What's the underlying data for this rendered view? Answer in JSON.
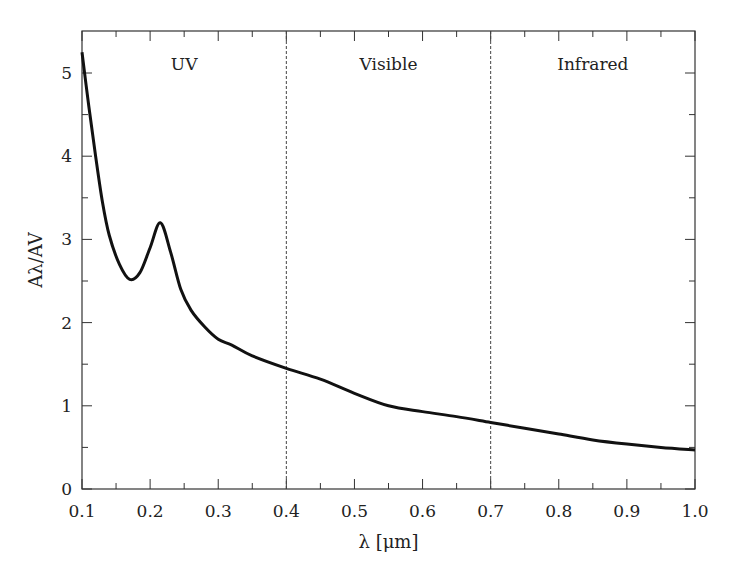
{
  "chart_data": {
    "type": "line",
    "title": "",
    "xlabel": "λ [μm]",
    "ylabel": "Aλ/AV",
    "xlim": [
      0.1,
      1.0
    ],
    "ylim": [
      0,
      5.3
    ],
    "xticks": [
      "0.1",
      "0.2",
      "0.3",
      "0.4",
      "0.5",
      "0.6",
      "0.7",
      "0.8",
      "0.9",
      "1.0"
    ],
    "yticks": [
      "0",
      "1",
      "2",
      "3",
      "4",
      "5"
    ],
    "grid": false,
    "regions": [
      {
        "label": "UV",
        "from": 0.1,
        "to": 0.4
      },
      {
        "label": "Visible",
        "from": 0.4,
        "to": 0.7
      },
      {
        "label": "Infrared",
        "from": 0.7,
        "to": 1.0
      }
    ],
    "boundaries": [
      0.4,
      0.7
    ],
    "series": [
      {
        "name": "extinction curve",
        "x": [
          0.1,
          0.11,
          0.12,
          0.13,
          0.14,
          0.155,
          0.17,
          0.185,
          0.2,
          0.215,
          0.23,
          0.245,
          0.26,
          0.28,
          0.3,
          0.32,
          0.35,
          0.4,
          0.45,
          0.5,
          0.55,
          0.6,
          0.65,
          0.7,
          0.75,
          0.8,
          0.85,
          0.9,
          0.95,
          1.0
        ],
        "y": [
          5.25,
          4.6,
          4.0,
          3.45,
          3.05,
          2.7,
          2.52,
          2.6,
          2.9,
          3.2,
          2.85,
          2.4,
          2.15,
          1.95,
          1.8,
          1.73,
          1.6,
          1.45,
          1.32,
          1.15,
          1.0,
          0.93,
          0.87,
          0.8,
          0.73,
          0.66,
          0.59,
          0.54,
          0.5,
          0.47
        ]
      }
    ]
  }
}
